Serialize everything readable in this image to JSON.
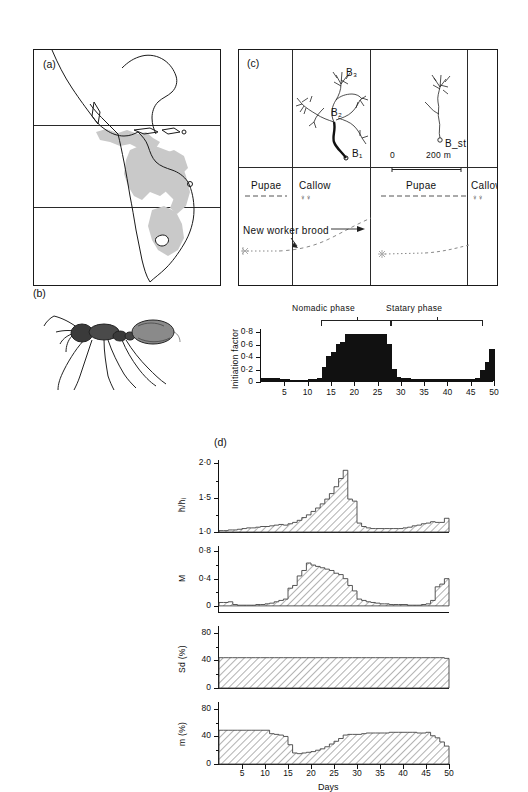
{
  "figure": {
    "panels": [
      "a",
      "b",
      "c",
      "d"
    ]
  },
  "panel_a": {
    "tag": "(a)",
    "description": "distribution-map-americas",
    "shade_color": "#c9c9c9",
    "outline_color": "#1a1a1a"
  },
  "panel_b": {
    "tag": "(b)",
    "description": "army-ant-worker-illustration"
  },
  "panel_c": {
    "tag": "(c)",
    "raid_labels": [
      "B₃",
      "B₂",
      "B₁",
      "B_st"
    ],
    "scale_bar": {
      "start": "0",
      "end": "200 m"
    },
    "brood_labels": [
      "Pupae",
      "Callow",
      "Pupae",
      "Callow"
    ],
    "callow_symbol": "♀♀",
    "annotation": "New worker brood"
  },
  "phases": {
    "nomadic": "Nomadic phase",
    "statary": "Statary phase"
  },
  "chart_data": [
    {
      "id": "initiation-factor",
      "type": "bar",
      "title": "",
      "xlabel": "Days",
      "ylabel": "Initiation factor",
      "xlim": [
        0,
        50
      ],
      "ylim": [
        0,
        0.85
      ],
      "yticks": [
        0,
        0.2,
        0.4,
        0.6,
        0.8
      ],
      "ytick_labels": [
        "0",
        "0·2",
        "0·4",
        "0·6",
        "0·8"
      ],
      "xticks": [
        5,
        10,
        15,
        20,
        25,
        30,
        35,
        40,
        45,
        50
      ],
      "grid": false,
      "fill": "#111111",
      "x": [
        1,
        2,
        3,
        4,
        5,
        6,
        7,
        8,
        9,
        10,
        11,
        12,
        13,
        14,
        15,
        16,
        17,
        18,
        19,
        20,
        21,
        22,
        23,
        24,
        25,
        26,
        27,
        28,
        29,
        30,
        31,
        32,
        33,
        34,
        35,
        36,
        37,
        38,
        39,
        40,
        41,
        42,
        43,
        44,
        45,
        46,
        47,
        48,
        49,
        50
      ],
      "values": [
        0.05,
        0.05,
        0.05,
        0.05,
        0.04,
        0.03,
        0.02,
        0.02,
        0.02,
        0.02,
        0.03,
        0.04,
        0.05,
        0.23,
        0.4,
        0.46,
        0.6,
        0.63,
        0.76,
        0.76,
        0.76,
        0.76,
        0.76,
        0.76,
        0.76,
        0.76,
        0.76,
        0.6,
        0.2,
        0.06,
        0.05,
        0.05,
        0.04,
        0.04,
        0.04,
        0.04,
        0.04,
        0.04,
        0.03,
        0.03,
        0.03,
        0.03,
        0.03,
        0.03,
        0.03,
        0.04,
        0.05,
        0.18,
        0.3,
        0.52
      ]
    },
    {
      "id": "relative-head-width",
      "type": "area",
      "xlabel": "",
      "ylabel": "h̄/h̄ᵢ",
      "xlim": [
        0,
        50
      ],
      "ylim": [
        1.0,
        2.05
      ],
      "yticks": [
        1.0,
        1.5,
        2.0
      ],
      "ytick_labels": [
        "1·0",
        "1·5",
        "2·0"
      ],
      "grid": false,
      "hatch": true,
      "x": [
        1,
        2,
        3,
        4,
        5,
        6,
        7,
        8,
        9,
        10,
        11,
        12,
        13,
        14,
        15,
        16,
        17,
        18,
        19,
        20,
        21,
        22,
        23,
        24,
        25,
        26,
        27,
        28,
        29,
        30,
        31,
        32,
        33,
        34,
        35,
        36,
        37,
        38,
        39,
        40,
        41,
        42,
        43,
        44,
        45,
        46,
        47,
        48,
        49,
        50
      ],
      "values": [
        1.02,
        1.02,
        1.03,
        1.03,
        1.04,
        1.05,
        1.06,
        1.06,
        1.07,
        1.08,
        1.08,
        1.09,
        1.1,
        1.11,
        1.1,
        1.12,
        1.14,
        1.17,
        1.21,
        1.25,
        1.3,
        1.35,
        1.41,
        1.48,
        1.56,
        1.66,
        1.78,
        1.9,
        1.48,
        1.45,
        1.13,
        1.08,
        1.06,
        1.05,
        1.05,
        1.05,
        1.05,
        1.05,
        1.05,
        1.05,
        1.06,
        1.07,
        1.09,
        1.1,
        1.12,
        1.13,
        1.15,
        1.14,
        1.14,
        1.2
      ]
    },
    {
      "id": "M-index",
      "type": "area",
      "xlabel": "",
      "ylabel": "M",
      "xlim": [
        0,
        50
      ],
      "ylim": [
        -0.09,
        0.88
      ],
      "yticks": [
        0,
        0.4,
        0.8
      ],
      "ytick_labels": [
        "0",
        "0·4",
        "0·8"
      ],
      "grid": false,
      "hatch": true,
      "x": [
        1,
        2,
        3,
        4,
        5,
        6,
        7,
        8,
        9,
        10,
        11,
        12,
        13,
        14,
        15,
        16,
        17,
        18,
        19,
        20,
        21,
        22,
        23,
        24,
        25,
        26,
        27,
        28,
        29,
        30,
        31,
        32,
        33,
        34,
        35,
        36,
        37,
        38,
        39,
        40,
        41,
        42,
        43,
        44,
        45,
        46,
        47,
        48,
        49,
        50
      ],
      "values": [
        0.05,
        0.05,
        0.06,
        0.02,
        0.01,
        0.01,
        0.01,
        0.01,
        0.02,
        0.02,
        0.03,
        0.04,
        0.06,
        0.08,
        0.1,
        0.26,
        0.3,
        0.44,
        0.52,
        0.63,
        0.6,
        0.58,
        0.56,
        0.54,
        0.52,
        0.48,
        0.46,
        0.4,
        0.3,
        0.22,
        0.1,
        0.08,
        0.06,
        0.05,
        0.04,
        0.03,
        0.03,
        0.02,
        0.02,
        0.02,
        0.02,
        0.01,
        0.01,
        0.01,
        0.02,
        0.03,
        0.08,
        0.28,
        0.32,
        0.4
      ]
    },
    {
      "id": "Sd-percent",
      "type": "area",
      "xlabel": "",
      "ylabel": "Sd (%)",
      "xlim": [
        0,
        50
      ],
      "ylim": [
        0,
        90
      ],
      "yticks": [
        0,
        40,
        80
      ],
      "ytick_labels": [
        "0",
        "40",
        "80"
      ],
      "grid": false,
      "hatch": true,
      "x": [
        1,
        2,
        3,
        4,
        5,
        6,
        7,
        8,
        9,
        10,
        11,
        12,
        13,
        14,
        15,
        16,
        17,
        18,
        19,
        20,
        21,
        22,
        23,
        24,
        25,
        26,
        27,
        28,
        29,
        30,
        31,
        32,
        33,
        34,
        35,
        36,
        37,
        38,
        39,
        40,
        41,
        42,
        43,
        44,
        45,
        46,
        47,
        48,
        49,
        50
      ],
      "values": [
        44,
        44,
        44,
        44,
        44,
        44,
        44,
        44,
        44,
        44,
        44,
        44,
        44,
        44,
        44,
        44,
        44,
        44,
        44,
        44,
        44,
        44,
        44,
        44,
        44,
        44,
        44,
        44,
        44,
        44,
        44,
        44,
        44,
        44,
        44,
        44,
        44,
        44,
        44,
        44,
        44,
        44,
        44,
        44,
        44,
        44,
        44,
        44,
        44,
        43
      ]
    },
    {
      "id": "m-percent",
      "type": "area",
      "xlabel": "Days",
      "ylabel": "m (%)",
      "xlim": [
        0,
        50
      ],
      "ylim": [
        0,
        90
      ],
      "yticks": [
        0,
        40,
        80
      ],
      "ytick_labels": [
        "0",
        "40",
        "80"
      ],
      "xticks": [
        5,
        10,
        15,
        20,
        25,
        30,
        35,
        40,
        45,
        50
      ],
      "grid": false,
      "hatch": true,
      "x": [
        1,
        2,
        3,
        4,
        5,
        6,
        7,
        8,
        9,
        10,
        11,
        12,
        13,
        14,
        15,
        16,
        17,
        18,
        19,
        20,
        21,
        22,
        23,
        24,
        25,
        26,
        27,
        28,
        29,
        30,
        31,
        32,
        33,
        34,
        35,
        36,
        37,
        38,
        39,
        40,
        41,
        42,
        43,
        44,
        45,
        46,
        47,
        48,
        49,
        50
      ],
      "values": [
        49,
        49,
        49,
        49,
        49,
        49,
        49,
        49,
        49,
        49,
        49,
        44,
        43,
        42,
        40,
        28,
        16,
        15,
        16,
        17,
        18,
        20,
        22,
        25,
        29,
        33,
        37,
        42,
        43,
        43,
        43,
        44,
        45,
        45,
        45,
        45,
        45,
        46,
        46,
        46,
        46,
        46,
        46,
        45,
        45,
        46,
        41,
        38,
        32,
        26
      ]
    }
  ]
}
